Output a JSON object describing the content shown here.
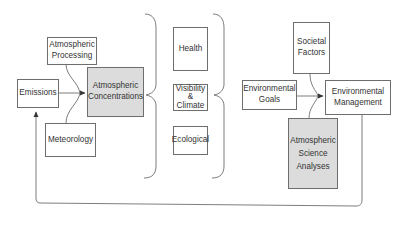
{
  "diagram": {
    "colors": {
      "line": "#6e6e6e",
      "box_border": "#6e6e6e",
      "shaded_fill": "#dcdcdc",
      "text": "#333333",
      "background": "#ffffff"
    },
    "nodes": {
      "atmospheric_processing": {
        "label": "Atmospheric\nProcessing",
        "shaded": false
      },
      "emissions": {
        "label": "Emissions",
        "shaded": false
      },
      "atmospheric_concentrations": {
        "label": "Atmospheric\nConcentrations",
        "shaded": true
      },
      "meteorology": {
        "label": "Meteorology",
        "shaded": false
      },
      "health": {
        "label": "Health",
        "shaded": false
      },
      "visibility_climate": {
        "label": "Visibility\n&\nClimate",
        "shaded": false
      },
      "ecological": {
        "label": "Ecological",
        "shaded": false
      },
      "environmental_goals": {
        "label": "Environmental\nGoals",
        "shaded": false
      },
      "societal_factors": {
        "label": "Societal\nFactors",
        "shaded": false
      },
      "environmental_management": {
        "label": "Environmental\nManagement",
        "shaded": false
      },
      "atmospheric_science_analyses": {
        "label": "Atmospheric\nScience\nAnalyses",
        "shaded": true
      }
    },
    "edges": [
      {
        "from": "emissions",
        "to": "atmospheric_concentrations",
        "type": "arrow"
      },
      {
        "from": "atmospheric_processing",
        "to": "atmospheric_concentrations",
        "type": "curve-merge"
      },
      {
        "from": "meteorology",
        "to": "atmospheric_concentrations",
        "type": "curve-merge"
      },
      {
        "from": "atmospheric_concentrations",
        "to": [
          "health",
          "visibility_climate",
          "ecological"
        ],
        "type": "brace"
      },
      {
        "from": [
          "health",
          "visibility_climate",
          "ecological"
        ],
        "to": "environmental_goals",
        "type": "brace"
      },
      {
        "from": "environmental_goals",
        "to": "environmental_management",
        "type": "arrow"
      },
      {
        "from": "societal_factors",
        "to": "environmental_management",
        "type": "curve-merge"
      },
      {
        "from": "atmospheric_science_analyses",
        "to": "environmental_management",
        "type": "curve-merge"
      },
      {
        "from": "environmental_management",
        "to": "emissions",
        "type": "feedback-loop"
      }
    ]
  }
}
